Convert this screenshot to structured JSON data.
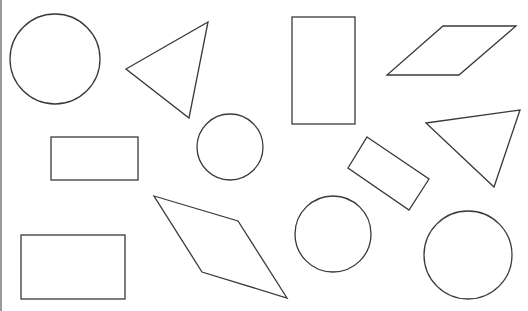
{
  "figure": {
    "width": 528,
    "height": 311,
    "stroke_color": "#3a3a3a",
    "background_color": "#ffffff",
    "border_color": "#9a9a9a"
  },
  "shapes": [
    {
      "id": "circle-1",
      "type": "circle",
      "cx": 55,
      "cy": 59,
      "r": 45
    },
    {
      "id": "triangle-1",
      "type": "triangle",
      "points": "126,69 208,22 189,118"
    },
    {
      "id": "rectangle-tall",
      "type": "rectangle",
      "x": 292,
      "y": 17,
      "w": 63,
      "h": 107
    },
    {
      "id": "parallelogram-1",
      "type": "parallelogram",
      "points": "443,26 516,26 459,75 387,75"
    },
    {
      "id": "rectangle-small",
      "type": "rectangle",
      "x": 51,
      "y": 137,
      "w": 87,
      "h": 43
    },
    {
      "id": "circle-2",
      "type": "circle",
      "cx": 230,
      "cy": 147,
      "r": 33
    },
    {
      "id": "rectangle-rotated",
      "type": "rotated-rectangle",
      "points": "367,137 429,179 409,210 348,168"
    },
    {
      "id": "triangle-2",
      "type": "triangle",
      "points": "426,123 520,110 494,187"
    },
    {
      "id": "rhombus-1",
      "type": "rhombus",
      "points": "154,196 238,221 287,298 202,272"
    },
    {
      "id": "circle-3",
      "type": "circle",
      "cx": 333,
      "cy": 234,
      "r": 38
    },
    {
      "id": "rectangle-bottom",
      "type": "rectangle",
      "x": 21,
      "y": 235,
      "w": 104,
      "h": 64
    },
    {
      "id": "circle-4",
      "type": "circle",
      "cx": 468,
      "cy": 255,
      "r": 44
    }
  ],
  "counts": {
    "circles": 4,
    "triangles": 2,
    "rectangles": 4,
    "parallelograms": 2
  }
}
